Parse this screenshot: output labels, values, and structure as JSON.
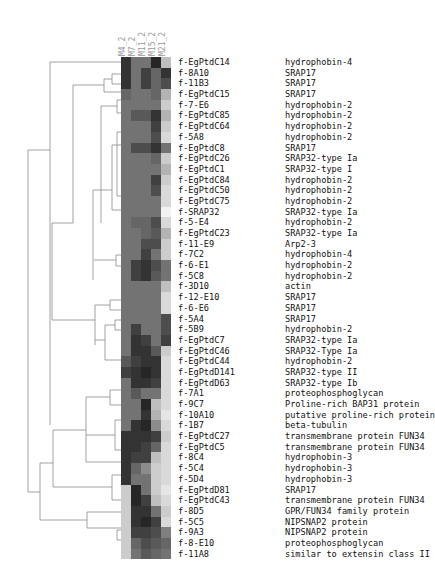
{
  "chart_data": {
    "type": "heatmap",
    "title": "",
    "columns": [
      "M4_2",
      "M7_2",
      "M11_2",
      "M15_2",
      "M21_2"
    ],
    "rows": [
      {
        "id": "f-EgPtdC14",
        "annotation": "hydrophobin-4",
        "values": [
          20,
          45,
          45,
          15,
          75
        ]
      },
      {
        "id": "f-8A10",
        "annotation": "SRAP17",
        "values": [
          20,
          45,
          25,
          40,
          20
        ]
      },
      {
        "id": "f-11B3",
        "annotation": "SRAP17",
        "values": [
          20,
          45,
          25,
          40,
          30
        ]
      },
      {
        "id": "f-EgPtdC15",
        "annotation": "SRAP17",
        "values": [
          40,
          45,
          45,
          40,
          70
        ]
      },
      {
        "id": "f-7-E6",
        "annotation": "hydrophobin-2",
        "values": [
          45,
          45,
          45,
          45,
          80
        ]
      },
      {
        "id": "f-EgPtdC85",
        "annotation": "hydrophobin-2",
        "values": [
          45,
          35,
          35,
          20,
          70
        ]
      },
      {
        "id": "f-EgPtdC64",
        "annotation": "hydrophobin-2",
        "values": [
          45,
          45,
          45,
          25,
          80
        ]
      },
      {
        "id": "f-5A8",
        "annotation": "hydrophobin-2",
        "values": [
          45,
          45,
          45,
          30,
          85
        ]
      },
      {
        "id": "f-EgPtdC8",
        "annotation": "SRAP17",
        "values": [
          45,
          30,
          30,
          20,
          45
        ]
      },
      {
        "id": "f-EgPtdC26",
        "annotation": "SRAP32-type Ia",
        "values": [
          45,
          45,
          45,
          40,
          80
        ]
      },
      {
        "id": "f-EgPtdC1",
        "annotation": "SRAP32-type I",
        "values": [
          45,
          45,
          45,
          45,
          70
        ]
      },
      {
        "id": "f-EgPtdC84",
        "annotation": "hydrophobin-2",
        "values": [
          45,
          45,
          45,
          25,
          80
        ]
      },
      {
        "id": "f-EgPtdC50",
        "annotation": "hydrophobin-2",
        "values": [
          45,
          45,
          45,
          30,
          85
        ]
      },
      {
        "id": "f-EgPtdC75",
        "annotation": "hydrophobin-2",
        "values": [
          45,
          45,
          45,
          45,
          85
        ]
      },
      {
        "id": "f-SRAP32",
        "annotation": "SRAP32-type Ia",
        "values": [
          45,
          45,
          45,
          45,
          95
        ]
      },
      {
        "id": "f-5-E4",
        "annotation": "hydrophobin-2",
        "values": [
          45,
          40,
          40,
          30,
          85
        ]
      },
      {
        "id": "f-EgPtdC23",
        "annotation": "SRAP32-type Ia",
        "values": [
          45,
          45,
          40,
          35,
          70
        ]
      },
      {
        "id": "f-11-E9",
        "annotation": "Arp2-3",
        "values": [
          45,
          45,
          30,
          30,
          80
        ]
      },
      {
        "id": "f-7C2",
        "annotation": "hydrophobin-4",
        "values": [
          45,
          45,
          25,
          45,
          80
        ]
      },
      {
        "id": "f-6-E1",
        "annotation": "hydrophobin-2",
        "values": [
          45,
          25,
          20,
          30,
          45
        ]
      },
      {
        "id": "f-5C8",
        "annotation": "hydrophobin-2",
        "values": [
          45,
          25,
          20,
          35,
          45
        ]
      },
      {
        "id": "f-3D10",
        "annotation": "actin",
        "values": [
          45,
          45,
          45,
          45,
          75
        ]
      },
      {
        "id": "f-12-E10",
        "annotation": "SRAP17",
        "values": [
          45,
          45,
          45,
          45,
          85
        ]
      },
      {
        "id": "f-6-E6",
        "annotation": "SRAP17",
        "values": [
          45,
          45,
          45,
          45,
          85
        ]
      },
      {
        "id": "f-5A4",
        "annotation": "SRAP17",
        "values": [
          45,
          45,
          45,
          45,
          30
        ]
      },
      {
        "id": "f-5B9",
        "annotation": "hydrophobin-2",
        "values": [
          45,
          25,
          45,
          45,
          30
        ]
      },
      {
        "id": "f-EgPtdC7",
        "annotation": "SRAP32-type Ia",
        "values": [
          45,
          20,
          25,
          45,
          25
        ]
      },
      {
        "id": "f-EgPtdC46",
        "annotation": "SRAP32-Type Ia",
        "values": [
          45,
          20,
          20,
          35,
          80
        ]
      },
      {
        "id": "f-EgPtdC44",
        "annotation": "hydrophobin-2",
        "values": [
          35,
          25,
          20,
          20,
          85
        ]
      },
      {
        "id": "f-EgPtdD141",
        "annotation": "SRAP32-type II",
        "values": [
          25,
          20,
          15,
          20,
          85
        ]
      },
      {
        "id": "f-EgPtdD63",
        "annotation": "SRAP32-type Ib",
        "values": [
          45,
          20,
          20,
          25,
          85
        ]
      },
      {
        "id": "f-7A1",
        "annotation": "proteophosphoglycan",
        "values": [
          45,
          35,
          45,
          45,
          85
        ]
      },
      {
        "id": "f-9C7",
        "annotation": "Proline-rich BAP31 protein",
        "values": [
          45,
          45,
          15,
          75,
          85
        ]
      },
      {
        "id": "f-10A10",
        "annotation": "putative proline-rich protein",
        "values": [
          45,
          45,
          20,
          70,
          90
        ]
      },
      {
        "id": "f-1B7",
        "annotation": "beta-tubulin",
        "values": [
          45,
          20,
          15,
          55,
          85
        ]
      },
      {
        "id": "f-EgPtdC27",
        "annotation": "transmembrane protein FUN34",
        "values": [
          20,
          20,
          20,
          25,
          80
        ]
      },
      {
        "id": "f-EgPtdC5",
        "annotation": "transmembrane protein FUN34",
        "values": [
          20,
          20,
          25,
          40,
          85
        ]
      },
      {
        "id": "f-8C4",
        "annotation": "hydrophobin-3",
        "values": [
          20,
          25,
          25,
          75,
          85
        ]
      },
      {
        "id": "f-5C4",
        "annotation": "hydrophobin-3",
        "values": [
          20,
          40,
          55,
          80,
          85
        ]
      },
      {
        "id": "f-5D4",
        "annotation": "hydrophobin-3",
        "values": [
          20,
          45,
          45,
          80,
          85
        ]
      },
      {
        "id": "f-EgPtdD81",
        "annotation": "SRAP17",
        "values": [
          80,
          15,
          45,
          80,
          90
        ]
      },
      {
        "id": "f-EgPtdC43",
        "annotation": "transmembrane protein FUN34",
        "values": [
          80,
          15,
          25,
          75,
          85
        ]
      },
      {
        "id": "f-8D5",
        "annotation": "GPR/FUN34 family protein",
        "values": [
          80,
          20,
          20,
          45,
          80
        ]
      },
      {
        "id": "f-5C5",
        "annotation": "NIPSNAP2 protein",
        "values": [
          80,
          20,
          15,
          25,
          85
        ]
      },
      {
        "id": "f-9A3",
        "annotation": "NIPSNAP2 protein",
        "values": [
          80,
          25,
          25,
          30,
          50
        ]
      },
      {
        "id": "f-8-E10",
        "annotation": "proteophosphoglycan",
        "values": [
          80,
          40,
          30,
          35,
          40
        ]
      },
      {
        "id": "f-11A8",
        "annotation": "similar to extensin class II",
        "values": [
          80,
          45,
          35,
          40,
          45
        ]
      }
    ],
    "value_scale": "grayscale (0 = black, 100 = white), relative expression",
    "dendrogram": "hierarchical clustering on left side of rows",
    "legend": null,
    "grid": false
  },
  "colors": {
    "line": "#888888",
    "text": "#111111",
    "col_label": "#999999"
  }
}
